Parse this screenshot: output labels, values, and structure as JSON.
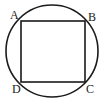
{
  "figure": {
    "type": "geometry-diagram",
    "background_color": "#ffffff",
    "stroke_color": "#1a1a1a",
    "label_color": "#1a1a1a",
    "canvas": {
      "width": 104,
      "height": 104
    },
    "circle": {
      "name": "circumscribed-circle",
      "center_x": 52,
      "center_y": 51,
      "radius": 46,
      "stroke_width": 1.6,
      "fill": "none"
    },
    "square": {
      "name": "inscribed-square",
      "x": 21,
      "y": 21,
      "width": 64,
      "height": 61,
      "stroke_width": 1.6,
      "fill": "none"
    },
    "vertices": [
      {
        "id": "A",
        "label": "A",
        "position": "top-left",
        "x": 21,
        "y": 21
      },
      {
        "id": "B",
        "label": "B",
        "position": "top-right",
        "x": 85,
        "y": 21
      },
      {
        "id": "C",
        "label": "C",
        "position": "bottom-right",
        "x": 85,
        "y": 82
      },
      {
        "id": "D",
        "label": "D",
        "position": "bottom-left",
        "x": 21,
        "y": 82
      }
    ]
  }
}
